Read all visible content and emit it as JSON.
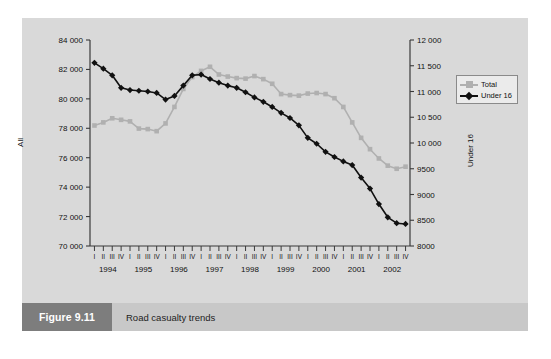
{
  "figure": {
    "number_label": "Figure 9.11",
    "caption": "Road casualty trends"
  },
  "colors": {
    "page_background": "#ffffff",
    "plate_background": "#d9d9d9",
    "caption_bar": "#c8c8c8",
    "caption_number_box": "#7d7d7d",
    "caption_number_text": "#ffffff",
    "axis": "#3a3a3a",
    "series_total": "#b0b0b0",
    "series_under16": "#111111",
    "legend_background": "#ebebeb",
    "legend_border": "#8a8a8a"
  },
  "chart_data": {
    "type": "line",
    "title": "Road casualty trends",
    "xlabel": "",
    "ylabel": "All",
    "y2label": "Under 16",
    "grid": false,
    "legend_position": "right",
    "ylim": [
      70000,
      84000
    ],
    "ytick_step": 2000,
    "ytick_labels": [
      "70 000",
      "72 000",
      "74 000",
      "76 000",
      "78 000",
      "80 000",
      "82 000",
      "84 000"
    ],
    "ytick_values": [
      70000,
      72000,
      74000,
      76000,
      78000,
      80000,
      82000,
      84000
    ],
    "y2lim": [
      8000,
      12000
    ],
    "y2tick_step": 500,
    "y2tick_labels": [
      "8000",
      "8500",
      "9000",
      "9500",
      "10 000",
      "10 500",
      "11 000",
      "11 500",
      "12 000"
    ],
    "y2tick_values": [
      8000,
      8500,
      9000,
      9500,
      10000,
      10500,
      11000,
      11500,
      12000
    ],
    "years": [
      "1994",
      "1995",
      "1996",
      "1997",
      "1998",
      "1999",
      "2000",
      "2001",
      "2002"
    ],
    "quarters": [
      "I",
      "II",
      "III",
      "IV"
    ],
    "x": [
      "1994 I",
      "1994 II",
      "1994 III",
      "1994 IV",
      "1995 I",
      "1995 II",
      "1995 III",
      "1995 IV",
      "1996 I",
      "1996 II",
      "1996 III",
      "1996 IV",
      "1997 I",
      "1997 II",
      "1997 III",
      "1997 IV",
      "1998 I",
      "1998 II",
      "1998 III",
      "1998 IV",
      "1999 I",
      "1999 II",
      "1999 III",
      "1999 IV",
      "2000 I",
      "2000 II",
      "2000 III",
      "2000 IV",
      "2001 I",
      "2001 II",
      "2001 III",
      "2001 IV",
      "2002 I",
      "2002 II",
      "2002 III",
      "2002 IV"
    ],
    "series": [
      {
        "name": "Total",
        "axis": "right",
        "color": "#b0b0b0",
        "marker": "square",
        "values": [
          10340,
          10400,
          10480,
          10450,
          10420,
          10280,
          10270,
          10230,
          10380,
          10700,
          11050,
          11280,
          11400,
          11480,
          11330,
          11290,
          11260,
          11250,
          11300,
          11240,
          11150,
          10950,
          10930,
          10920,
          10960,
          10970,
          10950,
          10870,
          10700,
          10400,
          10100,
          9880,
          9700,
          9560,
          9500,
          9540
        ]
      },
      {
        "name": "Under 16",
        "axis": "left",
        "color": "#111111",
        "marker": "diamond",
        "values": [
          82450,
          82050,
          81600,
          80750,
          80600,
          80550,
          80500,
          80400,
          79950,
          80200,
          80900,
          81600,
          81650,
          81350,
          81100,
          80900,
          80750,
          80450,
          80100,
          79800,
          79450,
          79050,
          78700,
          78200,
          77350,
          76950,
          76400,
          76050,
          75750,
          75500,
          74650,
          73900,
          72850,
          71950,
          71550,
          71500
        ]
      }
    ]
  },
  "legend": {
    "items": [
      {
        "label": "Total",
        "color": "#b0b0b0",
        "marker": "square"
      },
      {
        "label": "Under 16",
        "color": "#111111",
        "marker": "diamond"
      }
    ]
  }
}
